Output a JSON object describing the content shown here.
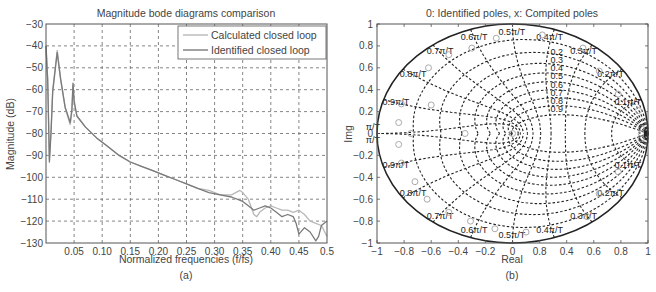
{
  "chart_data": [
    {
      "type": "line",
      "panel_caption": "(a)",
      "title": "Magnitude bode diagrams comparison",
      "xlabel": "Normalized frequencies (f/fs)",
      "ylabel": "Magnitude (dB)",
      "xlim": [
        0,
        0.5
      ],
      "ylim": [
        -130,
        -30
      ],
      "xticks": [
        0.05,
        0.1,
        0.15,
        0.2,
        0.25,
        0.3,
        0.35,
        0.4,
        0.45,
        0.5
      ],
      "xtick_labels": [
        "0.05",
        "0.10",
        "0.15",
        "0.20",
        "0.25",
        "0.30",
        "0.35",
        "0.40",
        "0.45",
        "0.5"
      ],
      "yticks": [
        -30,
        -40,
        -50,
        -60,
        -70,
        -80,
        -90,
        -100,
        -110,
        -120,
        -130
      ],
      "ytick_labels": [
        "−30",
        "−40",
        "−50",
        "−60",
        "−70",
        "−80",
        "−90",
        "−100",
        "−110",
        "−120",
        "−130"
      ],
      "grid": true,
      "legend_position": "top-right",
      "series": [
        {
          "name": "Calculated closed loop",
          "color": "#b8b8b8",
          "x": [
            0.0,
            0.003,
            0.006,
            0.009,
            0.012,
            0.02,
            0.026,
            0.034,
            0.043,
            0.046,
            0.048,
            0.05,
            0.055,
            0.07,
            0.09,
            0.11,
            0.13,
            0.15,
            0.17,
            0.19,
            0.21,
            0.23,
            0.25,
            0.27,
            0.29,
            0.31,
            0.33,
            0.345,
            0.35,
            0.36,
            0.37,
            0.375,
            0.38,
            0.39,
            0.4,
            0.41,
            0.42,
            0.43,
            0.44,
            0.45,
            0.46,
            0.47,
            0.48,
            0.49,
            0.5
          ],
          "y": [
            -40,
            -55,
            -92,
            -78,
            -60,
            -42,
            -55,
            -68,
            -76,
            -70,
            -58,
            -66,
            -72,
            -77,
            -82,
            -86,
            -90,
            -93,
            -95,
            -97,
            -99,
            -101,
            -103,
            -105,
            -106,
            -108,
            -108,
            -106,
            -107,
            -110,
            -117,
            -118,
            -116,
            -114,
            -113,
            -114,
            -115,
            -115,
            -116,
            -115,
            -117,
            -120,
            -121,
            -122,
            -127
          ]
        },
        {
          "name": "Identified closed loop",
          "color": "#7a7a7a",
          "x": [
            0.0,
            0.003,
            0.006,
            0.009,
            0.012,
            0.02,
            0.026,
            0.034,
            0.043,
            0.046,
            0.048,
            0.05,
            0.055,
            0.07,
            0.09,
            0.11,
            0.13,
            0.15,
            0.17,
            0.19,
            0.21,
            0.23,
            0.25,
            0.27,
            0.29,
            0.31,
            0.33,
            0.35,
            0.36,
            0.37,
            0.38,
            0.39,
            0.4,
            0.41,
            0.42,
            0.43,
            0.44,
            0.445,
            0.45,
            0.46,
            0.47,
            0.48,
            0.485,
            0.49,
            0.5
          ],
          "y": [
            -40,
            -56,
            -93,
            -79,
            -61,
            -43,
            -55,
            -68,
            -75,
            -69,
            -57,
            -65,
            -72,
            -77,
            -82,
            -86,
            -90,
            -93,
            -95,
            -97,
            -99,
            -101,
            -103,
            -105,
            -107,
            -108,
            -109,
            -111,
            -113,
            -115,
            -114,
            -113,
            -114,
            -116,
            -118,
            -117,
            -118,
            -121,
            -126,
            -123,
            -125,
            -129,
            -127,
            -122,
            -120
          ]
        }
      ]
    },
    {
      "type": "scatter",
      "panel_caption": "(b)",
      "title": "0: Identified poles,  x: Compited poles",
      "xlabel": "Real",
      "ylabel": "Img",
      "xlim": [
        -1,
        1
      ],
      "ylim": [
        -1,
        1
      ],
      "xticks": [
        -1,
        -0.8,
        -0.6,
        -0.4,
        -0.2,
        0,
        0.2,
        0.4,
        0.6,
        0.8,
        1
      ],
      "xtick_labels": [
        "−1",
        "−0.8",
        "−0.6",
        "−0.4",
        "−0.2",
        "0",
        "0.8",
        "0.4",
        "0.6",
        "0.8",
        "1"
      ],
      "yticks": [
        1,
        0.8,
        0.6,
        0.4,
        0.2,
        0,
        -0.2,
        -0.4,
        -0.6,
        -0.8,
        -1
      ],
      "ytick_labels": [
        "1",
        "0.8",
        "0.6",
        "0.4",
        "0.2",
        "0",
        "−0.2",
        "−0.4",
        "−0.6",
        "−0.8",
        "−1"
      ],
      "grid": "zgrid",
      "damping_labels": [
        "0.1",
        "0.2",
        "0.3",
        "0.4",
        "0.5",
        "0.6",
        "0.7",
        "0.8",
        "0.9"
      ],
      "damping_label_text": [
        "0.2",
        "0.3",
        "0.4",
        "0.5",
        "0.6",
        "0.7",
        "0.8",
        "0.9"
      ],
      "frequency_labels": [
        {
          "text": "0.1π/T",
          "w": 0.1,
          "side": "upper"
        },
        {
          "text": "0.2π/T",
          "w": 0.2,
          "side": "upper"
        },
        {
          "text": "0.3π/T",
          "w": 0.3,
          "side": "upper"
        },
        {
          "text": "0.4π/T",
          "w": 0.4,
          "side": "upper"
        },
        {
          "text": "0.5π/T",
          "w": 0.5,
          "side": "upper"
        },
        {
          "text": "0.6π/T",
          "w": 0.6,
          "side": "upper"
        },
        {
          "text": "0.7π/T",
          "w": 0.7,
          "side": "upper"
        },
        {
          "text": "0.8π/T",
          "w": 0.8,
          "side": "upper"
        },
        {
          "text": "0.9π/T",
          "w": 0.9,
          "side": "upper"
        },
        {
          "text": "π/T",
          "w": 1.0,
          "side": "upper"
        },
        {
          "text": "π/T",
          "w": 1.0,
          "side": "lower"
        },
        {
          "text": "0.9π/T",
          "w": 0.9,
          "side": "lower"
        },
        {
          "text": "0.8π/T",
          "w": 0.8,
          "side": "lower"
        },
        {
          "text": "0.7π/T",
          "w": 0.7,
          "side": "lower"
        },
        {
          "text": "0.6π/T",
          "w": 0.6,
          "side": "lower"
        },
        {
          "text": "0.5π/T",
          "w": 0.5,
          "side": "lower"
        },
        {
          "text": "0.4π/T",
          "w": 0.4,
          "side": "lower"
        },
        {
          "text": "0.3π/T",
          "w": 0.3,
          "side": "lower"
        },
        {
          "text": "0.2π/T",
          "w": 0.2,
          "side": "lower"
        },
        {
          "text": "0.1π/T",
          "w": 0.1,
          "side": "lower"
        }
      ],
      "series": [
        {
          "name": "Identified poles",
          "marker": "o",
          "color": "#aaaaaa",
          "points": [
            [
              -0.84,
              0.1
            ],
            [
              -0.84,
              -0.1
            ],
            [
              -0.82,
              0.27
            ],
            [
              -0.82,
              -0.27
            ],
            [
              -0.6,
              0.26
            ],
            [
              -0.47,
              0.72
            ],
            [
              -0.47,
              -0.72
            ],
            [
              -0.62,
              0.6
            ],
            [
              -0.63,
              -0.6
            ],
            [
              -0.72,
              -0.44
            ],
            [
              -0.3,
              0.78
            ],
            [
              -0.31,
              -0.8
            ],
            [
              -0.12,
              0.87
            ],
            [
              -0.13,
              -0.87
            ],
            [
              0.22,
              0.9
            ],
            [
              0.1,
              -0.9
            ],
            [
              0.52,
              0.78
            ],
            [
              0.55,
              -0.76
            ],
            [
              0.64,
              0.57
            ],
            [
              0.64,
              -0.55
            ],
            [
              0.78,
              0.36
            ],
            [
              0.78,
              -0.35
            ],
            [
              0.93,
              0.21
            ],
            [
              -0.75,
              0.0
            ],
            [
              -0.35,
              0.0
            ],
            [
              0.0,
              0.0
            ],
            [
              0.95,
              0.0
            ],
            [
              0.95,
              0.05
            ],
            [
              0.95,
              -0.05
            ]
          ]
        }
      ]
    }
  ]
}
